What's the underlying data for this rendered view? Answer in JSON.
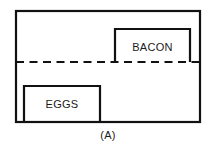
{
  "figure": {
    "caption": "(A)",
    "stroke_color": "#111111",
    "background_color": "#ffffff",
    "outer_region": {
      "name": "outer-rectangle"
    },
    "divider": {
      "name": "dashed-divider",
      "style": "dashed"
    },
    "boxes": [
      {
        "id": "bacon",
        "label": "BACON",
        "position": "upper-right",
        "bottom_edge_style": "dashed"
      },
      {
        "id": "eggs",
        "label": "EGGS",
        "position": "lower-left",
        "bottom_edge_style": "solid"
      }
    ]
  }
}
